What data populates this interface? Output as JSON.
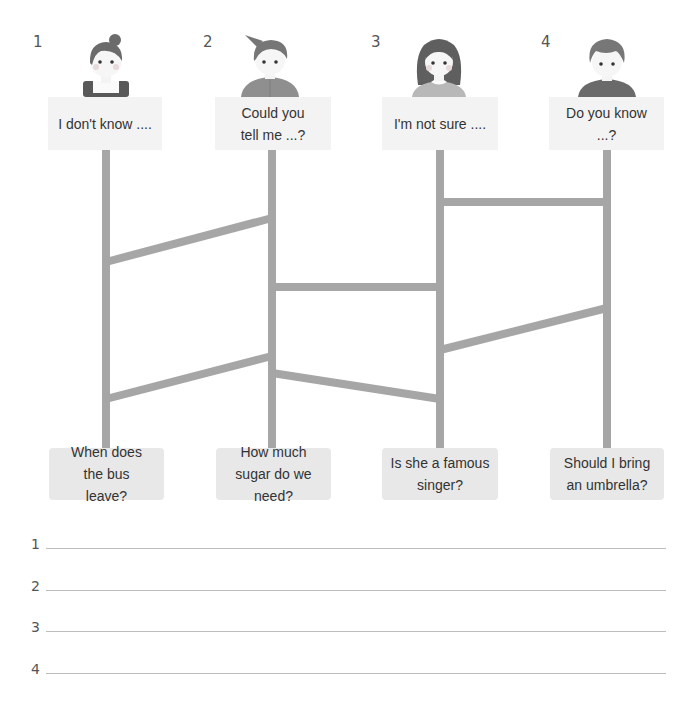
{
  "columns": [
    {
      "number": "1",
      "avatar": "girl-with-bun",
      "prompt": "I don't know ....",
      "question": "When does the bus leave?"
    },
    {
      "number": "2",
      "avatar": "boy-with-spiky-hair",
      "prompt": "Could you tell me ...?",
      "question": "How much sugar do we need?"
    },
    {
      "number": "3",
      "avatar": "girl-with-long-hair",
      "prompt": "I'm not sure ....",
      "question": "Is she a famous singer?"
    },
    {
      "number": "4",
      "avatar": "boy-with-curly-hair",
      "prompt": "Do you know ...?",
      "question": "Should I bring an umbrella?"
    }
  ],
  "ladder": {
    "color": "#a6a6a6",
    "rails_x": [
      106,
      272,
      440,
      607
    ],
    "rungs": [
      {
        "from_col": 1,
        "to_col": 2,
        "y_left": 262,
        "y_right": 218
      },
      {
        "from_col": 1,
        "to_col": 2,
        "y_left": 399,
        "y_right": 356
      },
      {
        "from_col": 2,
        "to_col": 3,
        "y_left": 287,
        "y_right": 287
      },
      {
        "from_col": 2,
        "to_col": 3,
        "y_left": 373,
        "y_right": 399
      },
      {
        "from_col": 3,
        "to_col": 4,
        "y_left": 202,
        "y_right": 202
      },
      {
        "from_col": 3,
        "to_col": 4,
        "y_left": 350,
        "y_right": 308
      }
    ]
  },
  "answers": [
    {
      "number": "1",
      "value": ""
    },
    {
      "number": "2",
      "value": ""
    },
    {
      "number": "3",
      "value": ""
    },
    {
      "number": "4",
      "value": ""
    }
  ]
}
